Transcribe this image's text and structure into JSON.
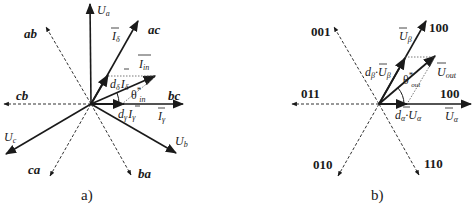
{
  "diagram_a": {
    "caption": "a)",
    "axes": {
      "Ua": {
        "main": "U",
        "sub": "a"
      },
      "Ub": {
        "main": "U",
        "sub": "b"
      },
      "Uc": {
        "main": "U",
        "sub": "c"
      }
    },
    "vector_labels": {
      "ab": "ab",
      "ac": "ac",
      "bc": "bc",
      "cb": "cb",
      "ca": "ca",
      "ba": "ba"
    },
    "I_delta": {
      "main": "I",
      "sub": "δ"
    },
    "I_gamma": {
      "main": "I",
      "sub": "γ"
    },
    "I_in": {
      "main": "I",
      "sub": "in"
    },
    "d_delta_I_delta": {
      "d": "d",
      "dsub": "δ",
      "main": "I",
      "sub": "δ"
    },
    "d_gamma_I_gamma": {
      "d": "d",
      "dsub": "γ",
      "main": "I",
      "sub": "γ"
    },
    "theta": {
      "main": "θ",
      "sup": "*",
      "sub": "in"
    }
  },
  "diagram_b": {
    "caption": "b)",
    "vector_labels": {
      "upper_right": "100",
      "upper_left": "001",
      "left": "011",
      "right": "100",
      "lower_left": "010",
      "lower_right": "110"
    },
    "U_beta": {
      "main": "U",
      "sub": "β"
    },
    "U_alpha": {
      "main": "U",
      "sub": "α"
    },
    "U_out": {
      "main": "U",
      "sub": "out"
    },
    "d_beta_U_beta": {
      "d": "d",
      "dsub": "β",
      "dot": "·",
      "main": "U",
      "sub": "β"
    },
    "d_alpha_U_alpha": {
      "d": "d",
      "dsub": "α",
      "dot": "·",
      "main": "U",
      "sub": "α"
    },
    "theta": {
      "main": "θ",
      "sup": "*",
      "sub": "out"
    }
  }
}
